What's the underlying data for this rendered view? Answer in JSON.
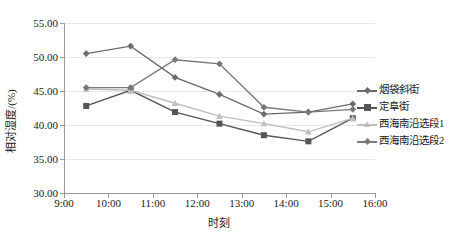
{
  "chart_data": {
    "type": "line",
    "title": "",
    "xlabel": "时刻",
    "ylabel": "相对湿度/(%)",
    "xlim": [
      "9:00",
      "16:00"
    ],
    "ylim": [
      30.0,
      55.0
    ],
    "ytick_labels": [
      "55.00",
      "50.00",
      "45.00",
      "40.00",
      "35.00",
      "30.00"
    ],
    "ytick_values": [
      55.0,
      50.0,
      45.0,
      40.0,
      35.0,
      30.0
    ],
    "xtick_labels": [
      "9:00",
      "10:00",
      "11:00",
      "12:00",
      "13:00",
      "14:00",
      "15:00",
      "16:00"
    ],
    "grid": "horizontal",
    "legend_position": "right",
    "x": [
      "9:30",
      "10:30",
      "11:00",
      "11:30",
      "12:00",
      "12:30",
      "13:00",
      "13:30",
      "14:00",
      "14:30",
      "15:00",
      "15:30"
    ],
    "series": [
      {
        "name": "烟袋斜街",
        "color": "#6b6b6b",
        "marker": "diamond",
        "values": [
          50.5,
          51.6,
          null,
          47.0,
          null,
          44.5,
          null,
          41.6,
          null,
          41.9,
          null,
          43.1
        ]
      },
      {
        "name": "定阜街",
        "color": "#555555",
        "marker": "square",
        "values": [
          42.8,
          45.1,
          null,
          41.9,
          null,
          40.2,
          null,
          38.5,
          null,
          37.6,
          null,
          41.0
        ]
      },
      {
        "name": "西海南沿选段1",
        "color": "#bfbfbf",
        "marker": "triangle",
        "values": [
          45.3,
          45.1,
          null,
          43.2,
          null,
          41.3,
          null,
          40.2,
          null,
          39.0,
          null,
          41.0
        ]
      },
      {
        "name": "西海南沿选段2",
        "color": "#787878",
        "marker": "diamond",
        "values": [
          45.5,
          45.5,
          null,
          49.6,
          null,
          49.0,
          null,
          42.6,
          null,
          41.9,
          null,
          42.3
        ]
      }
    ]
  },
  "legend": {
    "items": [
      {
        "label": "烟袋斜街",
        "color": "#6b6b6b"
      },
      {
        "label": "定阜街",
        "color": "#555555"
      },
      {
        "label": "西海南沿选段1",
        "color": "#bfbfbf"
      },
      {
        "label": "西海南沿选段2",
        "color": "#787878"
      }
    ]
  }
}
